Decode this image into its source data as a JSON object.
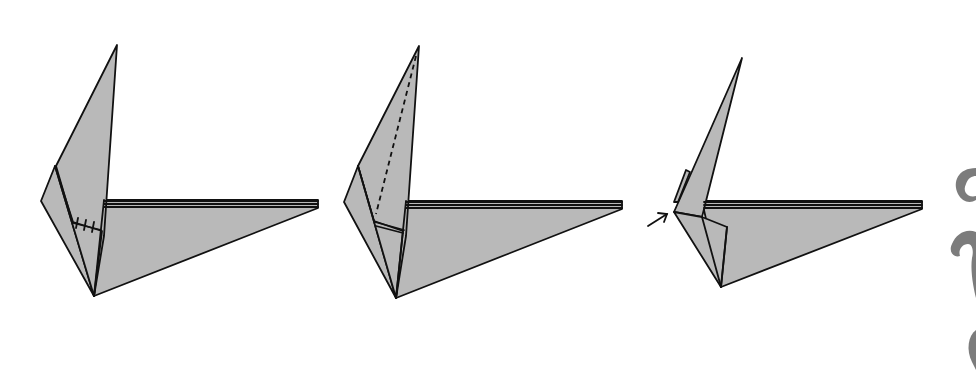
{
  "diagram": {
    "type": "origami-instruction-steps",
    "colors": {
      "paper": "#b9b9b9",
      "line": "#111111",
      "background": "#ffffff",
      "ornament": "#7c7c7c"
    },
    "steps": [
      {
        "index": 1,
        "description": "Folded model with inner flap marked by three tick marks (equal-length crease indicator)",
        "symbols": [
          "tick-marks"
        ]
      },
      {
        "index": 2,
        "description": "Valley-fold crease shown as dashed line along the upright point",
        "symbols": [
          "valley-fold-dashed-line"
        ]
      },
      {
        "index": 3,
        "description": "Arrow indicating inside-reverse fold / push at the left corner",
        "symbols": [
          "push-arrow"
        ]
      }
    ],
    "ornament": "decorative swirl at right edge (partially cropped)"
  }
}
